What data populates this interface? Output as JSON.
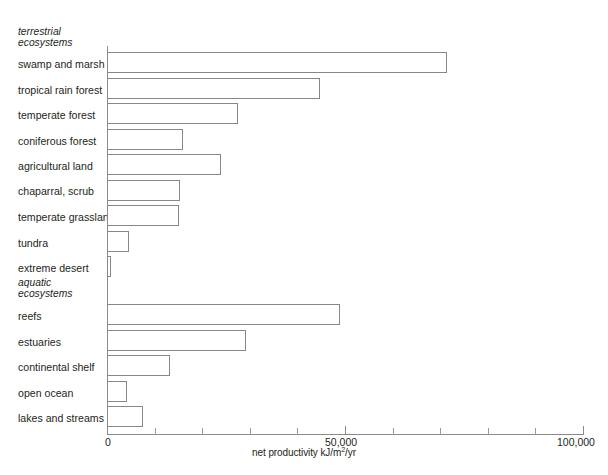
{
  "chart_data": {
    "type": "bar",
    "orientation": "horizontal",
    "title": "",
    "xlabel": "net productivity kJ/m2/yr",
    "xlabel_parts": {
      "before": "net productivity kJ/m",
      "sup": "2",
      "after": "/yr"
    },
    "ylabel": "",
    "xlim": [
      0,
      100000
    ],
    "grid": false,
    "legend": null,
    "tick_labels": [
      "0",
      "50,000",
      "100,000"
    ],
    "tick_values": [
      0,
      50000,
      100000
    ],
    "minor_tick_values": [
      10000,
      20000,
      30000,
      40000,
      60000,
      70000,
      80000,
      90000
    ],
    "groups": [
      {
        "name": "terrestrial ecosystems",
        "name_line1": "terrestrial",
        "name_line2": "ecosystems",
        "categories": [
          "swamp and marsh",
          "tropical rain forest",
          "temperate forest",
          "coniferous forest",
          "agricultural land",
          "chaparral, scrub",
          "temperate grassland",
          "tundra",
          "extreme desert"
        ],
        "values": [
          71400,
          44700,
          27500,
          16000,
          24000,
          15300,
          15100,
          4600,
          850
        ]
      },
      {
        "name": "aquatic ecosystems",
        "name_line1": "aquatic",
        "name_line2": "ecosystems",
        "categories": [
          "reefs",
          "estuaries",
          "continental shelf",
          "open ocean",
          "lakes and streams"
        ],
        "values": [
          49000,
          29200,
          13200,
          4200,
          7600
        ]
      }
    ],
    "categories": [
      "swamp and marsh",
      "tropical rain forest",
      "temperate forest",
      "coniferous forest",
      "agricultural land",
      "chaparral, scrub",
      "temperate grassland",
      "tundra",
      "extreme desert",
      "reefs",
      "estuaries",
      "continental shelf",
      "open ocean",
      "lakes and streams"
    ],
    "values": [
      71400,
      44700,
      27500,
      16000,
      24000,
      15300,
      15100,
      4600,
      850,
      49000,
      29200,
      13200,
      4200,
      7600
    ],
    "colors": {
      "bar_fill": "#ffffff",
      "bar_stroke": "#86878a",
      "axis": "#8a8a8a",
      "text": "#231f20"
    }
  },
  "caption": ""
}
